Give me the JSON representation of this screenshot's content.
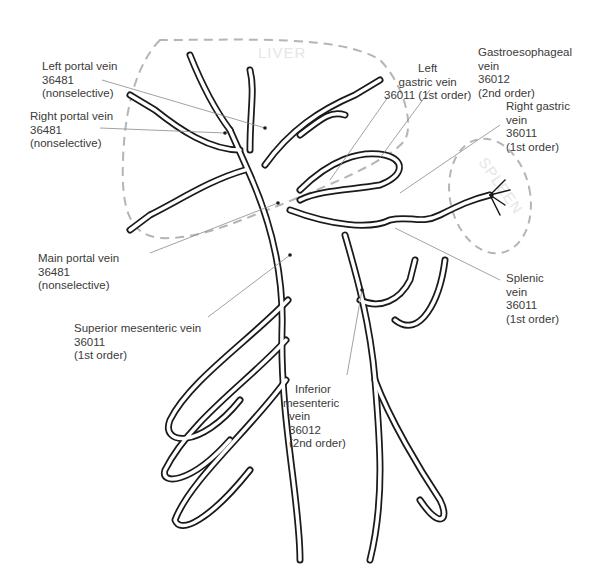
{
  "diagram": {
    "organs": [
      {
        "id": "liver",
        "label": "LIVER",
        "outline": "dashed",
        "color": "#b5b5b5"
      },
      {
        "id": "spleen",
        "label": "SPLEEN",
        "outline": "dashed",
        "color": "#b5b5b5"
      }
    ],
    "labels": [
      {
        "id": "left-portal-vein",
        "lines": [
          "Left portal vein",
          "36481",
          "(nonselective)"
        ],
        "name": "Left portal vein",
        "code": "36481",
        "order": "nonselective"
      },
      {
        "id": "right-portal-vein",
        "lines": [
          "Right portal vein",
          "36481",
          "(nonselective)"
        ],
        "name": "Right portal vein",
        "code": "36481",
        "order": "nonselective"
      },
      {
        "id": "left-gastric-vein",
        "lines": [
          "Left",
          "gastric vein",
          "36011 (1st order)"
        ],
        "name": "Left gastric vein",
        "code": "36011",
        "order": "1st order"
      },
      {
        "id": "gastroesophageal-vein",
        "lines": [
          "Gastroesophageal",
          "vein",
          "36012",
          "(2nd order)"
        ],
        "name": "Gastroesophageal vein",
        "code": "36012",
        "order": "2nd order"
      },
      {
        "id": "right-gastric-vein",
        "lines": [
          "Right gastric",
          "vein",
          "36011",
          "(1st order)"
        ],
        "name": "Right gastric vein",
        "code": "36011",
        "order": "1st order"
      },
      {
        "id": "main-portal-vein",
        "lines": [
          "Main portal vein",
          "36481",
          "(nonselective)"
        ],
        "name": "Main portal vein",
        "code": "36481",
        "order": "nonselective"
      },
      {
        "id": "splenic-vein",
        "lines": [
          "Splenic",
          "vein",
          "36011",
          "(1st order)"
        ],
        "name": "Splenic vein",
        "code": "36011",
        "order": "1st order"
      },
      {
        "id": "superior-mesenteric-vein",
        "lines": [
          "Superior mesenteric vein",
          "36011",
          "(1st order)"
        ],
        "name": "Superior mesenteric vein",
        "code": "36011",
        "order": "1st order"
      },
      {
        "id": "inferior-mesenteric-vein",
        "lines": [
          "Inferior",
          "mesenteric",
          "vein",
          "36012",
          "(2nd order)"
        ],
        "name": "Inferior mesenteric vein",
        "code": "36012",
        "order": "2nd order"
      }
    ],
    "colors": {
      "vessel": "#1a1a1a",
      "leader": "#8a8a8a",
      "organ_outline": "#b5b5b5",
      "text": "#3a3a3a"
    }
  }
}
